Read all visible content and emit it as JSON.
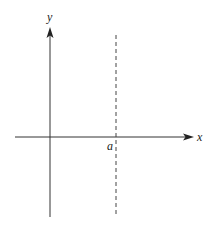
{
  "diagram": {
    "x_axis_label": "x",
    "y_axis_label": "y",
    "vertical_line_label": "a",
    "colors": {
      "axis": "#333333",
      "dashed": "#444444",
      "text": "#222222"
    }
  }
}
